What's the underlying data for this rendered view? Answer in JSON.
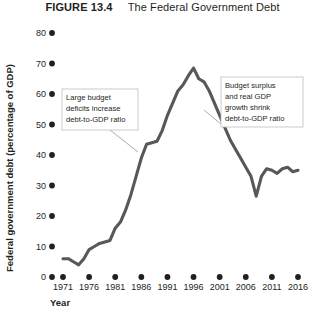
{
  "figure": {
    "label": "FIGURE 13.4",
    "title": "The Federal Government Debt"
  },
  "chart_data": {
    "type": "line",
    "title": "The Federal Government Debt",
    "xlabel": "Year",
    "ylabel": "Federal government debt (percentage of GDP)",
    "xlim": [
      1971,
      2016
    ],
    "ylim": [
      0,
      80
    ],
    "xticks": [
      "1971",
      "1976",
      "1981",
      "1986",
      "1991",
      "1996",
      "2001",
      "2006",
      "2011",
      "2016"
    ],
    "yticks": [
      "0",
      "10",
      "20",
      "30",
      "40",
      "50",
      "60",
      "70",
      "80"
    ],
    "grid": false,
    "legend": "none",
    "line_color": "#58585a",
    "series": [
      {
        "name": "Federal government debt",
        "x": [
          1971,
          1972,
          1973,
          1974,
          1975,
          1976,
          1977,
          1978,
          1979,
          1980,
          1981,
          1982,
          1983,
          1984,
          1985,
          1986,
          1987,
          1988,
          1989,
          1990,
          1991,
          1992,
          1993,
          1994,
          1995,
          1996,
          1997,
          1998,
          1999,
          2000,
          2001,
          2002,
          2003,
          2004,
          2005,
          2006,
          2007,
          2008,
          2009,
          2010,
          2011,
          2012,
          2013,
          2014,
          2015,
          2016
        ],
        "values": [
          6.0,
          6.0,
          5.0,
          4.0,
          6.0,
          9.0,
          10.0,
          11.0,
          11.5,
          12.0,
          16.0,
          18.0,
          22.0,
          27.0,
          33.0,
          39.0,
          43.5,
          44.0,
          44.5,
          48.0,
          53.0,
          57.0,
          61.0,
          63.0,
          66.0,
          68.5,
          65.0,
          64.0,
          61.0,
          57.0,
          53.0,
          49.0,
          45.0,
          42.0,
          39.0,
          36.0,
          33.0,
          26.5,
          33.0,
          35.5,
          35.0,
          34.0,
          35.5,
          36.0,
          34.5,
          35.0
        ]
      }
    ],
    "annotations": [
      {
        "id": "left-annotation",
        "text": "Large budget deficits increase debt-to-GDP ratio",
        "lines": [
          "Large budget",
          "deficits increase",
          "debt-to-GDP ratio"
        ],
        "points_at_year": 1988,
        "points_at_value": 44
      },
      {
        "id": "right-annotation",
        "text": "Budget surplus and real GDP growth shrink debt-to-GDP ratio",
        "lines": [
          "Budget surplus",
          "and real GDP",
          "growth shrink",
          "debt-to-GDP ratio"
        ],
        "points_at_year": 1999,
        "points_at_value": 60
      }
    ]
  }
}
